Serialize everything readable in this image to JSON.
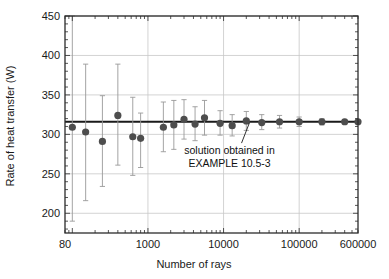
{
  "chart_data": {
    "type": "scatter",
    "title": "",
    "subtitle": "",
    "xlabel": "Number of rays",
    "ylabel": "Rate of heat transfer (W)",
    "xscale": "log",
    "yscale": "linear",
    "xlim": [
      80,
      600000
    ],
    "ylim": [
      175,
      450
    ],
    "grid": true,
    "legend": null,
    "xticks": [
      {
        "value": 80,
        "label": "80"
      },
      {
        "value": 1000,
        "label": "1000"
      },
      {
        "value": 10000,
        "label": "10000"
      },
      {
        "value": 100000,
        "label": "100000"
      },
      {
        "value": 600000,
        "label": "600000"
      }
    ],
    "yticks": [
      {
        "value": 200,
        "label": "200"
      },
      {
        "value": 250,
        "label": "250"
      },
      {
        "value": 300,
        "label": "300"
      },
      {
        "value": 350,
        "label": "350"
      },
      {
        "value": 400,
        "label": "400"
      },
      {
        "value": 450,
        "label": "450"
      }
    ],
    "reference_line": {
      "name": "solution obtained in EXAMPLE 10.5-3",
      "y": 316,
      "color": "#1a1a1a"
    },
    "annotations": [
      {
        "text_line1": "solution obtained in",
        "text_line2": "EXAMPLE 10.5-3",
        "x": 12000,
        "y": 275,
        "leader_from_x": 22000,
        "leader_from_y": 316
      }
    ],
    "marker": {
      "shape": "circle",
      "color": "#4d4d4d",
      "size": 5
    },
    "errorbar": {
      "color": "#9a9a9a"
    },
    "series": [
      {
        "name": "Monte Carlo estimate of rate of heat transfer",
        "points": [
          {
            "x": 100,
            "y": 309,
            "yerr_low": 190,
            "yerr_high": 450
          },
          {
            "x": 150,
            "y": 303,
            "yerr_low": 216,
            "yerr_high": 389
          },
          {
            "x": 250,
            "y": 291,
            "yerr_low": 234,
            "yerr_high": 349
          },
          {
            "x": 400,
            "y": 324,
            "yerr_low": 261,
            "yerr_high": 389
          },
          {
            "x": 630,
            "y": 297,
            "yerr_low": 248,
            "yerr_high": 347
          },
          {
            "x": 800,
            "y": 295,
            "yerr_low": 258,
            "yerr_high": 327
          },
          {
            "x": 1600,
            "y": 309,
            "yerr_low": 278,
            "yerr_high": 341
          },
          {
            "x": 2200,
            "y": 312,
            "yerr_low": 281,
            "yerr_high": 343
          },
          {
            "x": 3000,
            "y": 319,
            "yerr_low": 294,
            "yerr_high": 344
          },
          {
            "x": 4200,
            "y": 313,
            "yerr_low": 292,
            "yerr_high": 335
          },
          {
            "x": 5600,
            "y": 321,
            "yerr_low": 299,
            "yerr_high": 343
          },
          {
            "x": 9000,
            "y": 314,
            "yerr_low": 299,
            "yerr_high": 330
          },
          {
            "x": 13000,
            "y": 311,
            "yerr_low": 298,
            "yerr_high": 325
          },
          {
            "x": 20000,
            "y": 317,
            "yerr_low": 305,
            "yerr_high": 329
          },
          {
            "x": 32000,
            "y": 315,
            "yerr_low": 306,
            "yerr_high": 325
          },
          {
            "x": 55000,
            "y": 316,
            "yerr_low": 308,
            "yerr_high": 324
          },
          {
            "x": 100000,
            "y": 316,
            "yerr_low": 310,
            "yerr_high": 322
          },
          {
            "x": 200000,
            "y": 316,
            "yerr_low": 312,
            "yerr_high": 320
          },
          {
            "x": 400000,
            "y": 316,
            "yerr_low": 313,
            "yerr_high": 319
          },
          {
            "x": 600000,
            "y": 316,
            "yerr_low": 314,
            "yerr_high": 318
          }
        ]
      }
    ]
  }
}
